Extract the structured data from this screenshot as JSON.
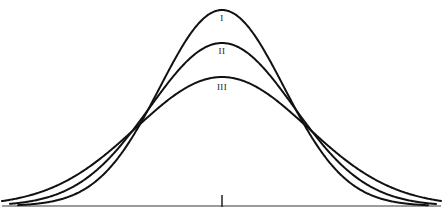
{
  "figure": {
    "width": 443,
    "height": 224,
    "background_color": "#ffffff",
    "curve_color": "#111111",
    "axis_color": "#7a7a7a",
    "tick_color": "#222222",
    "curve_stroke_width": 2.0,
    "axis_stroke_width": 1.3
  },
  "labels": {
    "curve_1": "I",
    "curve_2": "II",
    "curve_3": "III"
  },
  "chart_data": {
    "type": "line",
    "title": "",
    "subtitle": "",
    "xlabel": "",
    "ylabel": "",
    "xlim": [
      -4.2,
      4.2
    ],
    "ylim": [
      0,
      1.05
    ],
    "grid": false,
    "legend": "inline-labels-at-peaks",
    "x_axis": {
      "baseline_y_px": 206,
      "center_tick": {
        "position": "center",
        "x_px": 222,
        "top_y_px": 195,
        "bottom_y_px": 207,
        "label": ""
      },
      "tick_labels": []
    },
    "series": [
      {
        "name": "I",
        "label": "I",
        "mean": 0,
        "sigma_px": 62,
        "peak_height_px": 196,
        "peak_y_px": 10,
        "peak_x_px": 222,
        "relative_peak": 1.0,
        "relative_spread": 0.78,
        "label_x_px": 222,
        "label_y_px": 14,
        "x": [
          -4.0,
          -3.5,
          -3.0,
          -2.5,
          -2.0,
          -1.5,
          -1.0,
          -0.5,
          0.0,
          0.5,
          1.0,
          1.5,
          2.0,
          2.5,
          3.0,
          3.5,
          4.0
        ],
        "values": [
          0.01,
          0.02,
          0.05,
          0.11,
          0.22,
          0.4,
          0.64,
          0.88,
          1.0,
          0.88,
          0.64,
          0.4,
          0.22,
          0.11,
          0.05,
          0.02,
          0.01
        ]
      },
      {
        "name": "II",
        "label": "II",
        "mean": 0,
        "sigma_px": 72,
        "peak_height_px": 163,
        "peak_y_px": 43,
        "peak_x_px": 222,
        "relative_peak": 0.83,
        "relative_spread": 0.9,
        "label_x_px": 222,
        "label_y_px": 47,
        "x": [
          -4.0,
          -3.5,
          -3.0,
          -2.5,
          -2.0,
          -1.5,
          -1.0,
          -0.5,
          0.0,
          0.5,
          1.0,
          1.5,
          2.0,
          2.5,
          3.0,
          3.5,
          4.0
        ],
        "values": [
          0.02,
          0.04,
          0.08,
          0.15,
          0.25,
          0.39,
          0.56,
          0.73,
          0.83,
          0.73,
          0.56,
          0.39,
          0.25,
          0.15,
          0.08,
          0.04,
          0.02
        ]
      },
      {
        "name": "III",
        "label": "III",
        "mean": 0,
        "sigma_px": 86,
        "peak_height_px": 129,
        "peak_y_px": 77,
        "peak_x_px": 222,
        "relative_peak": 0.66,
        "relative_spread": 1.0,
        "label_x_px": 222,
        "label_y_px": 83,
        "x": [
          -4.0,
          -3.5,
          -3.0,
          -2.5,
          -2.0,
          -1.5,
          -1.0,
          -0.5,
          0.0,
          0.5,
          1.0,
          1.5,
          2.0,
          2.5,
          3.0,
          3.5,
          4.0
        ],
        "values": [
          0.04,
          0.07,
          0.12,
          0.19,
          0.28,
          0.39,
          0.5,
          0.61,
          0.66,
          0.61,
          0.5,
          0.39,
          0.28,
          0.19,
          0.12,
          0.07,
          0.04
        ]
      }
    ],
    "intersections": [
      {
        "between": [
          "I",
          "III"
        ],
        "x_px": 152,
        "y_px": 118
      },
      {
        "between": [
          "I",
          "II"
        ],
        "x_px": 163,
        "y_px": 104
      },
      {
        "between": [
          "I",
          "II"
        ],
        "x_px": 281,
        "y_px": 104
      },
      {
        "between": [
          "I",
          "III"
        ],
        "x_px": 292,
        "y_px": 118
      }
    ]
  }
}
